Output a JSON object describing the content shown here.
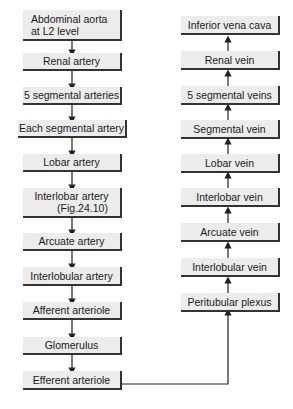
{
  "arterial_chain": [
    {
      "label_1": "Abdominal aorta",
      "label_2": "at L2 level"
    },
    {
      "label_1": "Renal artery"
    },
    {
      "label_1": "5 segmental arteries"
    },
    {
      "label_1": "Each segmental artery"
    },
    {
      "label_1": "Lobar artery"
    },
    {
      "label_1": "Interlobar artery",
      "label_2": "(Fig.24.10)"
    },
    {
      "label_1": "Arcuate artery"
    },
    {
      "label_1": "Interlobular artery"
    },
    {
      "label_1": "Afferent arteriole"
    },
    {
      "label_1": "Glomerulus"
    },
    {
      "label_1": "Efferent arteriole"
    }
  ],
  "venous_chain": [
    {
      "label_1": "Inferior vena cava"
    },
    {
      "label_1": "Renal vein"
    },
    {
      "label_1": "5 segmental veins"
    },
    {
      "label_1": "Segmental vein"
    },
    {
      "label_1": "Lobar vein"
    },
    {
      "label_1": "Interlobar vein"
    },
    {
      "label_1": "Arcuate vein"
    },
    {
      "label_1": "Interlobular vein"
    },
    {
      "label_1": "Peritubular plexus"
    }
  ],
  "colors": {
    "box_fill": "#ececec",
    "border": "#333333",
    "text": "#1a1a1a"
  }
}
